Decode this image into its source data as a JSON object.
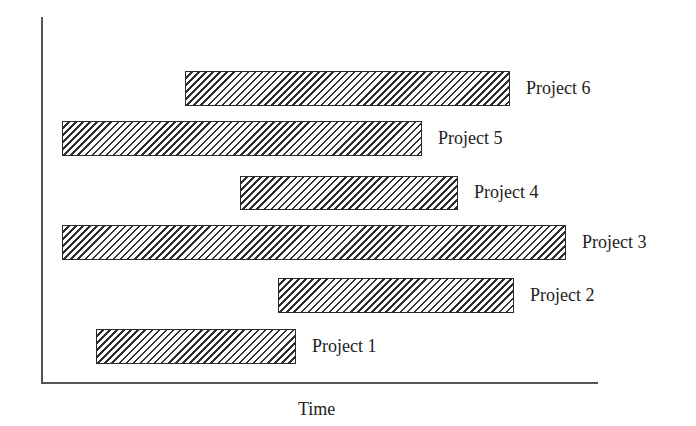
{
  "chart_data": {
    "type": "bar",
    "subtype": "gantt",
    "orientation": "horizontal",
    "title": "",
    "xlabel": "Time",
    "ylabel": "",
    "grid": false,
    "legend": null,
    "axis_ticks": "none",
    "categories": [
      "Project 1",
      "Project 2",
      "Project 3",
      "Project 4",
      "Project 5",
      "Project 6"
    ],
    "series": [
      {
        "name": "Project duration",
        "fill_pattern": "diagonal-hatch",
        "bars": [
          {
            "label": "Project 1",
            "start": 54,
            "end": 254,
            "row_top": 329,
            "row_bottom": 364
          },
          {
            "label": "Project 2",
            "start": 236,
            "end": 472,
            "row_top": 278,
            "row_bottom": 313
          },
          {
            "label": "Project 3",
            "start": 20,
            "end": 524,
            "row_top": 225,
            "row_bottom": 260
          },
          {
            "label": "Project 4",
            "start": 198,
            "end": 416,
            "row_top": 176,
            "row_bottom": 210
          },
          {
            "label": "Project 5",
            "start": 20,
            "end": 380,
            "row_top": 121,
            "row_bottom": 156
          },
          {
            "label": "Project 6",
            "start": 143,
            "end": 468,
            "row_top": 71,
            "row_bottom": 106
          }
        ]
      }
    ],
    "xlim": [
      0,
      556
    ],
    "note": "Relative time units measured in pixels from the y-axis; no numeric tick labels are shown."
  },
  "colors": {
    "axis": "#555555",
    "bar_border": "#2b2b2b",
    "hatch": "#2f2f2f",
    "text": "#222222",
    "background": "#ffffff"
  }
}
